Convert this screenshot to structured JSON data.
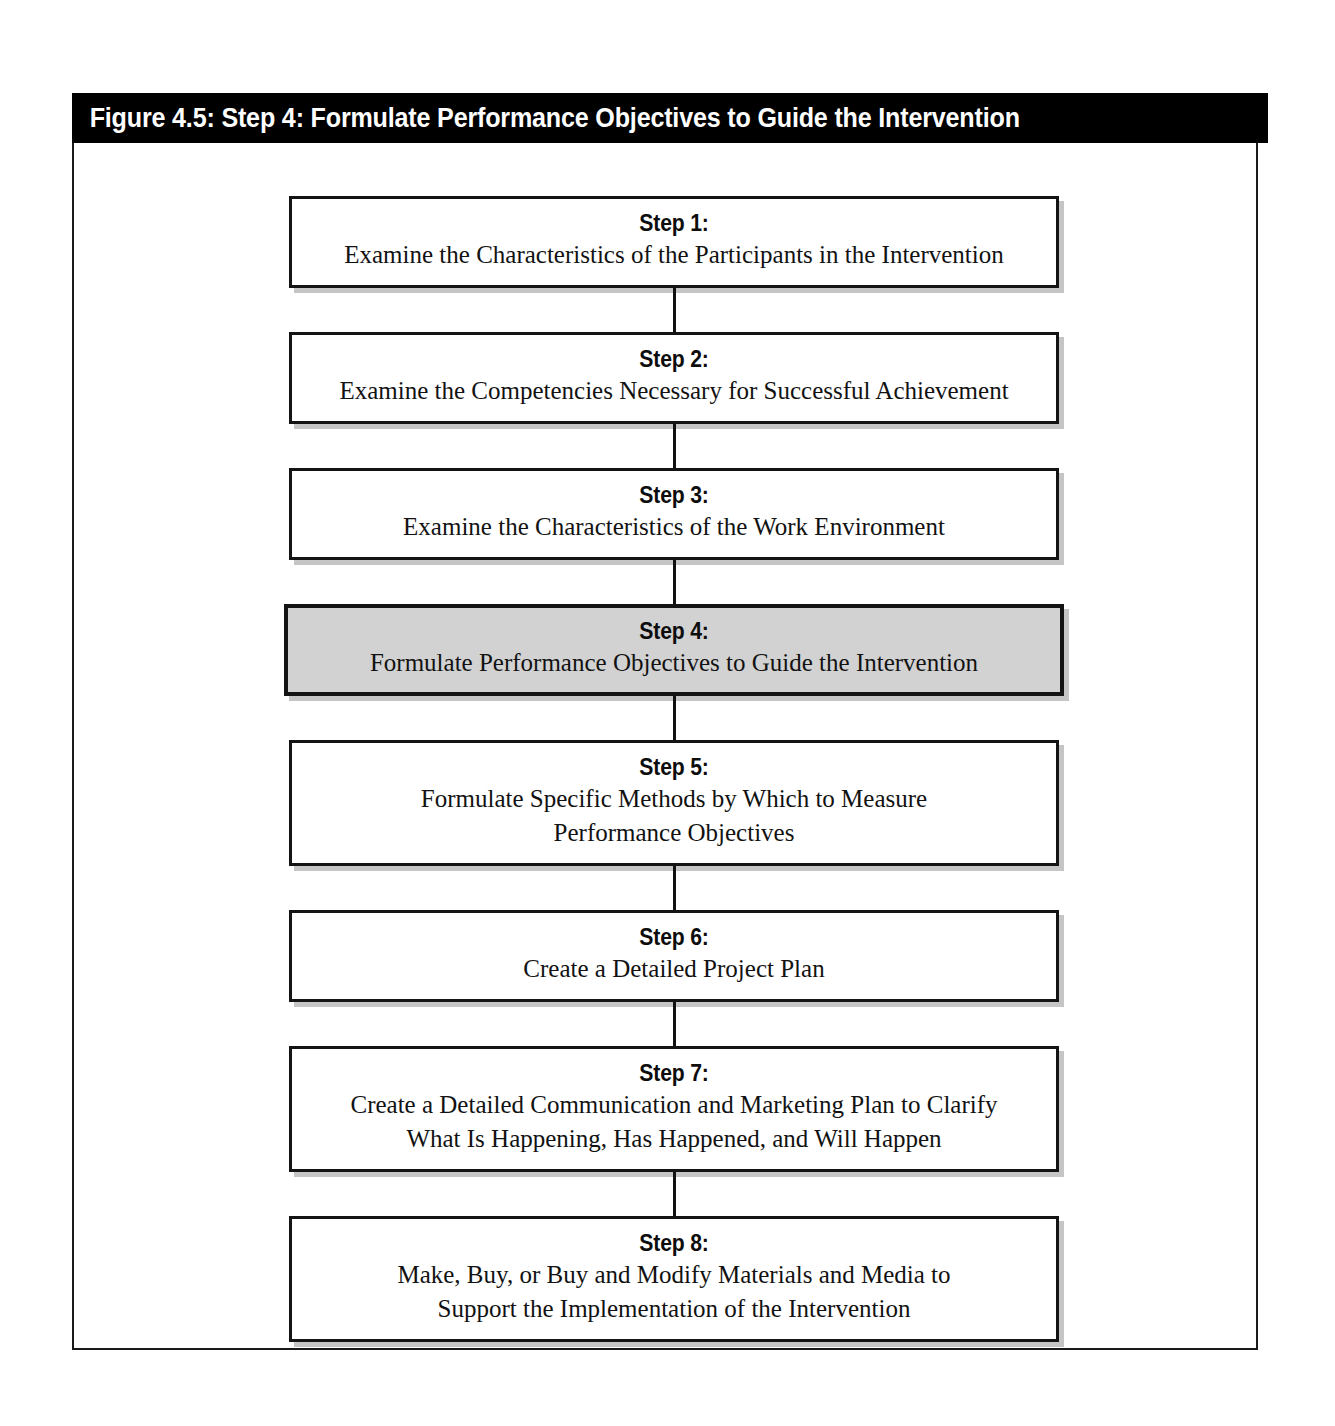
{
  "figure": {
    "title": "Figure 4.5: Step 4: Formulate Performance Objectives to Guide the Intervention",
    "highlight_color": "#d2d2d2",
    "title_bar_color": "#000000",
    "border_color": "#141414"
  },
  "steps": [
    {
      "label": "Step 1:",
      "description": "Examine the Characteristics of the Participants in the Intervention",
      "highlighted": false
    },
    {
      "label": "Step 2:",
      "description": "Examine the Competencies Necessary for Successful Achievement",
      "highlighted": false
    },
    {
      "label": "Step 3:",
      "description": "Examine the Characteristics of the Work Environment",
      "highlighted": false
    },
    {
      "label": "Step 4:",
      "description": "Formulate Performance Objectives to Guide the Intervention",
      "highlighted": true
    },
    {
      "label": "Step 5:",
      "description": "Formulate Specific Methods by Which to Measure\nPerformance Objectives",
      "highlighted": false
    },
    {
      "label": "Step 6:",
      "description": "Create a Detailed Project Plan",
      "highlighted": false
    },
    {
      "label": "Step 7:",
      "description": "Create a Detailed Communication and Marketing Plan to Clarify\nWhat Is Happening, Has Happened, and Will Happen",
      "highlighted": false
    },
    {
      "label": "Step 8:",
      "description": "Make, Buy, or Buy and Modify Materials and Media to\nSupport the Implementation of the Intervention",
      "highlighted": false
    }
  ]
}
